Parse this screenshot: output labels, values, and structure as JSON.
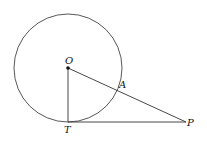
{
  "diagram": {
    "circle": {
      "cx": 68,
      "cy": 68,
      "r": 54
    },
    "points": {
      "O": {
        "x": 68,
        "y": 68,
        "label": "O"
      },
      "T": {
        "x": 68,
        "y": 122,
        "label": "T"
      },
      "P": {
        "x": 186,
        "y": 122,
        "label": "P"
      },
      "A": {
        "x": 117,
        "y": 88,
        "label": "A"
      }
    },
    "segments": [
      [
        "O",
        "T"
      ],
      [
        "T",
        "P"
      ],
      [
        "O",
        "P"
      ]
    ],
    "stroke_color": "#333333"
  }
}
